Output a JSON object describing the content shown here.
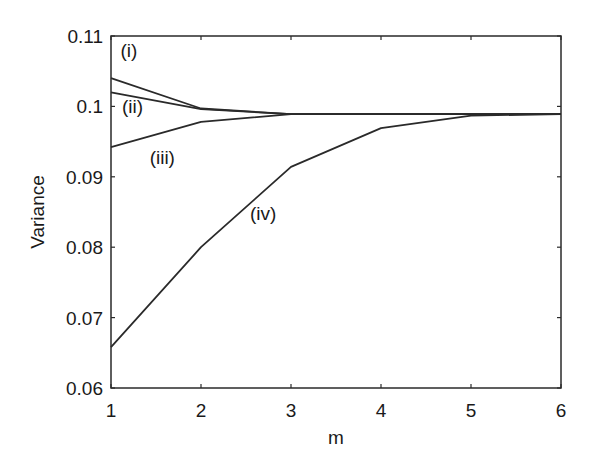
{
  "chart_data": {
    "type": "line",
    "title": "",
    "xlabel": "m",
    "ylabel": "Variance",
    "x": [
      1,
      2,
      3,
      4,
      5,
      6
    ],
    "xlim": [
      1,
      6
    ],
    "ylim": [
      0.06,
      0.11
    ],
    "xticks": [
      1,
      2,
      3,
      4,
      5,
      6
    ],
    "xtick_labels": [
      "1",
      "2",
      "3",
      "4",
      "5",
      "6"
    ],
    "yticks": [
      0.06,
      0.07,
      0.08,
      0.09,
      0.1,
      0.11
    ],
    "ytick_labels": [
      "0.06",
      "0.07",
      "0.08",
      "0.09",
      "0.1",
      "0.11"
    ],
    "grid": false,
    "legend": "none (inline annotations)",
    "series": [
      {
        "name": "(i)",
        "values": [
          0.104,
          0.0997,
          0.0989,
          0.0989,
          0.0989,
          0.0989
        ]
      },
      {
        "name": "(ii)",
        "values": [
          0.102,
          0.0996,
          0.0989,
          0.0989,
          0.0989,
          0.0989
        ]
      },
      {
        "name": "(iii)",
        "values": [
          0.0942,
          0.0978,
          0.0989,
          0.0989,
          0.0989,
          0.0989
        ]
      },
      {
        "name": "(iv)",
        "values": [
          0.0658,
          0.08,
          0.0914,
          0.0969,
          0.0987,
          0.0989
        ]
      }
    ],
    "annotations": [
      {
        "text": "(i)",
        "x": 1.2,
        "y": 0.107
      },
      {
        "text": "(ii)",
        "x": 1.24,
        "y": 0.099
      },
      {
        "text": "(iii)",
        "x": 1.57,
        "y": 0.0918
      },
      {
        "text": "(iv)",
        "x": 2.69,
        "y": 0.0838
      }
    ]
  },
  "colors": {
    "line": "#2a2a2a",
    "axes": "#2a2a2a",
    "background": "#ffffff"
  }
}
